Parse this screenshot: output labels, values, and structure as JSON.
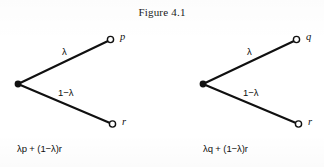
{
  "figure": {
    "title": "Figure 4.1",
    "background_color": "#ffffff",
    "ink_color": "#101010"
  },
  "diagrams": [
    {
      "name": "left-lottery-tree",
      "root": {
        "label": "",
        "x": 18,
        "y": 84
      },
      "branches": [
        {
          "name": "upper-branch",
          "probability_label": "λ",
          "outcome_label": "p",
          "prob_label_x": 62,
          "prob_label_y": 52,
          "endpoint_x": 108,
          "endpoint_y": 41,
          "outcome_label_x": 118,
          "outcome_label_y": 37
        },
        {
          "name": "lower-branch",
          "probability_label": "1−λ",
          "outcome_label": "r",
          "prob_label_x": 60,
          "prob_label_y": 94,
          "endpoint_x": 110,
          "endpoint_y": 123,
          "outcome_label_x": 120,
          "outcome_label_y": 119
        }
      ],
      "expected_value": "λp + (1−λ)r",
      "expression_x": 17,
      "expression_y": 148
    },
    {
      "name": "right-lottery-tree",
      "root": {
        "label": "",
        "x": 203,
        "y": 84
      },
      "branches": [
        {
          "name": "upper-branch",
          "probability_label": "λ",
          "outcome_label": "q",
          "prob_label_x": 247,
          "prob_label_y": 52,
          "endpoint_x": 294,
          "endpoint_y": 41,
          "outcome_label_x": 304,
          "outcome_label_y": 37
        },
        {
          "name": "lower-branch",
          "probability_label": "1−λ",
          "outcome_label": "r",
          "prob_label_x": 245,
          "prob_label_y": 94,
          "endpoint_x": 296,
          "endpoint_y": 123,
          "outcome_label_x": 306,
          "outcome_label_y": 119
        }
      ],
      "expected_value": "λq + (1−λ)r",
      "expression_x": 203,
      "expression_y": 148
    }
  ]
}
